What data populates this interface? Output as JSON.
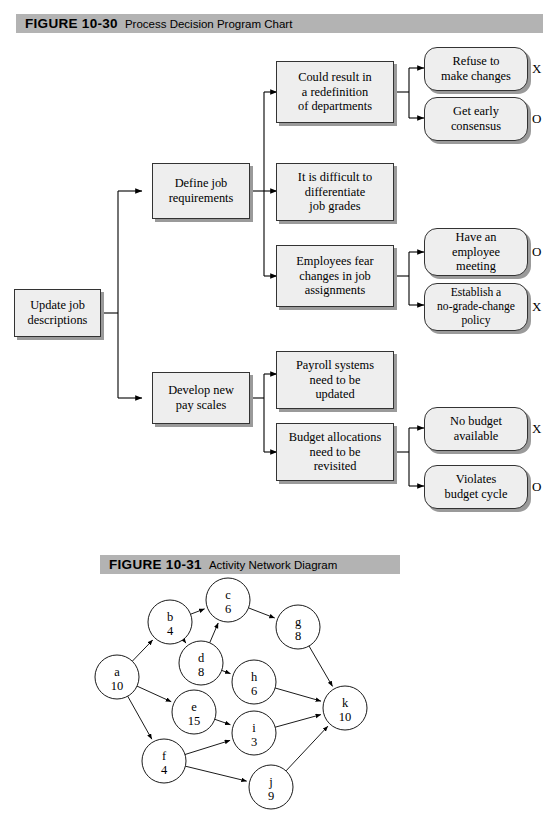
{
  "figures": [
    {
      "number": "FIGURE 10-30",
      "title": "Process Decision Program Chart"
    },
    {
      "number": "FIGURE 10-31",
      "title": "Activity Network Diagram"
    }
  ],
  "pdpc": {
    "root": {
      "label": "Update job\ndescriptions"
    },
    "level1": [
      {
        "label": "Define job\nrequirements"
      },
      {
        "label": "Develop new\npay scales"
      }
    ],
    "level2": [
      {
        "label": "Could result in\na redefinition\nof departments"
      },
      {
        "label": "It is difficult to\ndifferentiate\njob grades"
      },
      {
        "label": "Employees fear\nchanges in job\nassignments"
      },
      {
        "label": "Payroll systems\nneed to be\nupdated"
      },
      {
        "label": "Budget allocations\nneed to be\nrevisited"
      }
    ],
    "level3": [
      {
        "label": "Refuse to\nmake changes",
        "marker": "X"
      },
      {
        "label": "Get early\nconsensus",
        "marker": "O"
      },
      {
        "label": "Have an\nemployee\nmeeting",
        "marker": "O"
      },
      {
        "label": "Establish a\nno-grade-change\npolicy",
        "marker": "X"
      },
      {
        "label": "No budget\navailable",
        "marker": "X"
      },
      {
        "label": "Violates\nbudget cycle",
        "marker": "O"
      }
    ]
  },
  "chart_data": {
    "type": "diagram",
    "title": "Activity Network Diagram",
    "nodes": [
      {
        "id": "a",
        "duration": "10",
        "cx": 117,
        "cy": 677
      },
      {
        "id": "b",
        "duration": "4",
        "cx": 170,
        "cy": 622
      },
      {
        "id": "c",
        "duration": "6",
        "cx": 228,
        "cy": 600
      },
      {
        "id": "d",
        "duration": "8",
        "cx": 201,
        "cy": 663
      },
      {
        "id": "e",
        "duration": "15",
        "cx": 194,
        "cy": 712
      },
      {
        "id": "f",
        "duration": "4",
        "cx": 164,
        "cy": 761
      },
      {
        "id": "g",
        "duration": "8",
        "cx": 298,
        "cy": 627
      },
      {
        "id": "h",
        "duration": "6",
        "cx": 254,
        "cy": 682
      },
      {
        "id": "i",
        "duration": "3",
        "cx": 254,
        "cy": 733
      },
      {
        "id": "j",
        "duration": "9",
        "cx": 271,
        "cy": 787
      },
      {
        "id": "k",
        "duration": "10",
        "cx": 345,
        "cy": 708
      }
    ],
    "edges": [
      [
        "a",
        "b"
      ],
      [
        "a",
        "e"
      ],
      [
        "a",
        "f"
      ],
      [
        "b",
        "c"
      ],
      [
        "b",
        "d"
      ],
      [
        "d",
        "c"
      ],
      [
        "d",
        "h"
      ],
      [
        "c",
        "g"
      ],
      [
        "g",
        "k"
      ],
      [
        "h",
        "k"
      ],
      [
        "e",
        "i"
      ],
      [
        "f",
        "i"
      ],
      [
        "f",
        "j"
      ],
      [
        "i",
        "k"
      ],
      [
        "j",
        "k"
      ]
    ]
  },
  "colors": {
    "header_bar": "#b3b3b3",
    "box_fill": "#eeeeee",
    "box_border": "#333333",
    "shadow": "#9a9a9a",
    "line": "#000000"
  }
}
